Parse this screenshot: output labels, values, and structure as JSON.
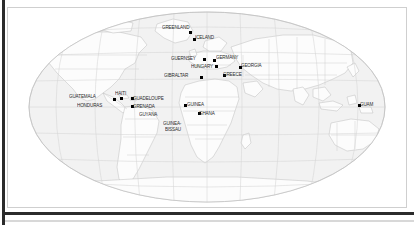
{
  "figure": {
    "type": "world-map",
    "projection": "robinson",
    "title": "",
    "background_color": "#ffffff",
    "ocean_color": "#f2f2f2",
    "land_color": "#fbfbfb",
    "graticule_color": "#d4d4d4",
    "coastline_color": "#b5b5b5",
    "border_color": "#cfcfcf",
    "label_color": "#2a2a2a",
    "marker_color": "#000000"
  },
  "map": {
    "labels": [
      {
        "name": "GREENLAND",
        "x": 155,
        "y": 18,
        "align": "left"
      },
      {
        "name": "ICELAND",
        "x": 188,
        "y": 28,
        "align": "left"
      },
      {
        "name": "GUERNSEY",
        "x": 164,
        "y": 49,
        "align": "left"
      },
      {
        "name": "GERMANY",
        "x": 209,
        "y": 48,
        "align": "left"
      },
      {
        "name": "HUNGARY",
        "x": 184,
        "y": 57,
        "align": "left"
      },
      {
        "name": "GEORGIA",
        "x": 234,
        "y": 56,
        "align": "left"
      },
      {
        "name": "GIBRALTAR",
        "x": 157,
        "y": 66,
        "align": "left"
      },
      {
        "name": "GREECE",
        "x": 216,
        "y": 65,
        "align": "left"
      },
      {
        "name": "GUATEMALA",
        "x": 62,
        "y": 87,
        "align": "left"
      },
      {
        "name": "HAITI",
        "x": 108,
        "y": 84,
        "align": "left"
      },
      {
        "name": "GUADELOUPE",
        "x": 126,
        "y": 89,
        "align": "left"
      },
      {
        "name": "HONDURAS",
        "x": 70,
        "y": 96,
        "align": "left"
      },
      {
        "name": "GRENADA",
        "x": 126,
        "y": 97,
        "align": "left"
      },
      {
        "name": "GUYANA",
        "x": 132,
        "y": 105,
        "align": "left"
      },
      {
        "name": "GUINEA",
        "x": 180,
        "y": 95,
        "align": "left"
      },
      {
        "name": "GHANA",
        "x": 192,
        "y": 104,
        "align": "left"
      },
      {
        "name": "GUINEA-",
        "x": 156,
        "y": 114,
        "align": "left"
      },
      {
        "name": "BISSAU",
        "x": 158,
        "y": 120,
        "align": "left"
      },
      {
        "name": "GUAM",
        "x": 353,
        "y": 95,
        "align": "left"
      }
    ],
    "markers": [
      {
        "name": "greenland-marker",
        "x": 182,
        "y": 24
      },
      {
        "name": "iceland-marker",
        "x": 186,
        "y": 31
      },
      {
        "name": "guernsey-marker",
        "x": 196,
        "y": 51
      },
      {
        "name": "germany-marker",
        "x": 206,
        "y": 52
      },
      {
        "name": "hungary-marker",
        "x": 208,
        "y": 58
      },
      {
        "name": "georgia-marker",
        "x": 232,
        "y": 59
      },
      {
        "name": "gibraltar-marker",
        "x": 193,
        "y": 69
      },
      {
        "name": "greece-marker",
        "x": 216,
        "y": 67
      },
      {
        "name": "guatemala-marker",
        "x": 106,
        "y": 91
      },
      {
        "name": "haiti-marker",
        "x": 113,
        "y": 90
      },
      {
        "name": "guadeloupe-marker",
        "x": 124,
        "y": 90
      },
      {
        "name": "grenada-marker",
        "x": 124,
        "y": 98
      },
      {
        "name": "guinea-marker",
        "x": 177,
        "y": 97
      },
      {
        "name": "ghana-marker",
        "x": 191,
        "y": 105
      },
      {
        "name": "guam-marker",
        "x": 351,
        "y": 97
      }
    ]
  }
}
